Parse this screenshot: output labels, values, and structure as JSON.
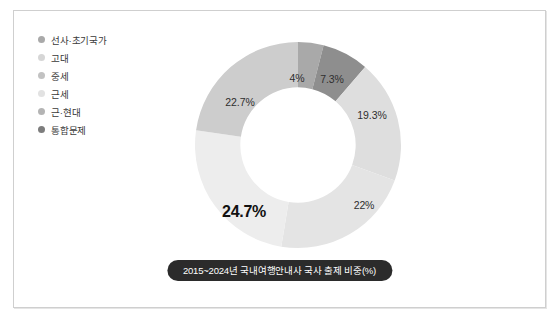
{
  "card": {
    "border_color": "#cfcfcf",
    "background": "#ffffff"
  },
  "legend": {
    "items": [
      {
        "label": "선사·초기국가",
        "color": "#8f8f8f"
      },
      {
        "label": "고대",
        "color": "#d6d6d6"
      },
      {
        "label": "중세",
        "color": "#c2c2c2"
      },
      {
        "label": "근세",
        "color": "#e2e2e2"
      },
      {
        "label": "근·현대",
        "color": "#b4b4b4"
      },
      {
        "label": "통합문제",
        "color": "#7d7d7d"
      }
    ]
  },
  "caption": {
    "text": "2015~2024년 국내여행안내사 국사 출제 비중(%)",
    "background": "#2b2b2b",
    "color": "#ffffff"
  },
  "chart_data": {
    "type": "pie",
    "title": "2015~2024년 국내여행안내사 국사 출제 비중(%)",
    "xlabel": "",
    "ylabel": "",
    "donut": true,
    "inner_radius_ratio": 0.56,
    "start_angle_deg": 0,
    "direction": "clockwise",
    "legend_position": "top-left",
    "grid": false,
    "categories": [
      "선사·초기국가",
      "통합문제",
      "고대",
      "중세",
      "근세",
      "근·현대"
    ],
    "values": [
      4,
      7.3,
      19.3,
      22,
      24.7,
      22.7
    ],
    "labels": [
      "4%",
      "7.3%",
      "19.3%",
      "22%",
      "24.7%",
      "22.7%"
    ],
    "colors": [
      "#a9a9a9",
      "#8e8e8e",
      "#dedede",
      "#e4e4e4",
      "#ededed",
      "#cdcdcd"
    ],
    "emphasis_index": 4,
    "slices": [
      {
        "name": "선사·초기국가",
        "value": 4,
        "label": "4%",
        "color": "#a9a9a9",
        "label_x": 105,
        "label_y": 39
      },
      {
        "name": "통합문제",
        "value": 7.3,
        "label": "7.3%",
        "color": "#8e8e8e",
        "label_x": 140,
        "label_y": 40
      },
      {
        "name": "고대",
        "value": 19.3,
        "label": "19.3%",
        "color": "#dedede",
        "label_x": 180,
        "label_y": 76
      },
      {
        "name": "중세",
        "value": 22,
        "label": "22%",
        "color": "#e4e4e4",
        "label_x": 172,
        "label_y": 166
      },
      {
        "name": "근세",
        "value": 24.7,
        "label": "24.7%",
        "color": "#ededed",
        "label_x": 52,
        "label_y": 173
      },
      {
        "name": "근·현대",
        "value": 22.7,
        "label": "22.7%",
        "color": "#cdcdcd",
        "label_x": 48,
        "label_y": 63
      }
    ]
  }
}
